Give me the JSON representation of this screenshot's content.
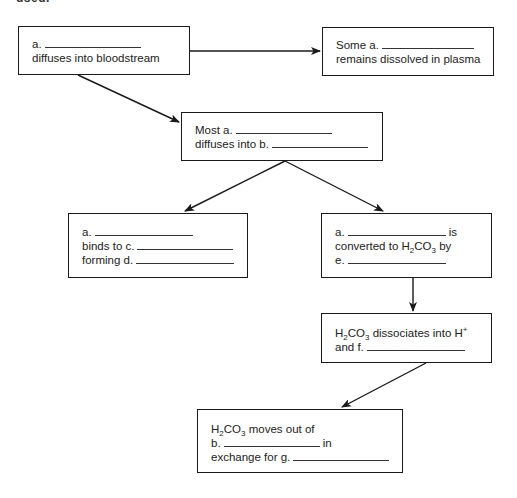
{
  "header": {
    "clipped_text": "used."
  },
  "nodes": [
    {
      "id": "co2-diffuses",
      "lines": [
        {
          "prefix": "a.",
          "blank": true,
          "suffix": ""
        },
        {
          "prefix": "diffuses into bloodstream",
          "blank": false,
          "suffix": ""
        }
      ]
    },
    {
      "id": "dissolved-plasma",
      "lines": [
        {
          "prefix": "Some a.",
          "blank": true,
          "suffix": ""
        },
        {
          "prefix": "remains dissolved in plasma",
          "blank": false,
          "suffix": ""
        }
      ]
    },
    {
      "id": "most-diffuses",
      "lines": [
        {
          "prefix": "Most a.",
          "blank": true,
          "suffix": ""
        },
        {
          "prefix": "diffuses into b.",
          "blank": true,
          "suffix": ""
        }
      ]
    },
    {
      "id": "binds",
      "lines": [
        {
          "prefix": "a.",
          "blank": true,
          "suffix": ""
        },
        {
          "prefix": "binds to c.",
          "blank": true,
          "suffix": ""
        },
        {
          "prefix": "forming d.",
          "blank": true,
          "suffix": ""
        }
      ]
    },
    {
      "id": "converted",
      "lines": [
        {
          "prefix": "a.",
          "blank": true,
          "suffix": "is"
        },
        {
          "prefix": "converted to H",
          "sub": "2",
          "mid": "CO",
          "sub2": "3",
          "after": " by",
          "blank": false
        },
        {
          "prefix": "e.",
          "blank": true,
          "suffix": ""
        }
      ]
    },
    {
      "id": "dissociates",
      "lines": [
        {
          "prefix": "H",
          "sub": "2",
          "mid": "CO",
          "sub2": "3",
          "after": " dissociates into H",
          "sup": "+"
        },
        {
          "prefix": "and f.",
          "blank": true,
          "suffix": ""
        }
      ]
    },
    {
      "id": "moves-out",
      "lines": [
        {
          "prefix": "H",
          "sub": "2",
          "mid": "CO",
          "sub2": "3",
          "after": " moves out of"
        },
        {
          "prefix": "b.",
          "blank": true,
          "suffix": "in"
        },
        {
          "prefix": "exchange for g.",
          "blank": true,
          "suffix": ""
        }
      ]
    }
  ],
  "colors": {
    "stroke": "#1a1a1a",
    "text": "#222222",
    "background": "#ffffff"
  }
}
